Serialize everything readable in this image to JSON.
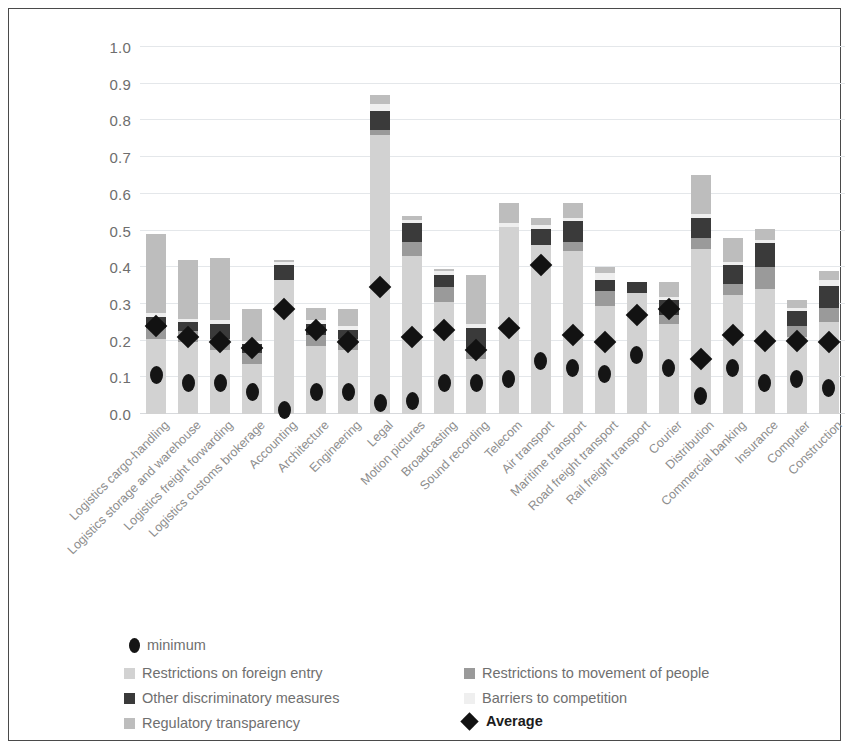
{
  "chart_data": {
    "type": "bar",
    "subtype": "stacked-bar-with-markers",
    "title": "",
    "xlabel": "",
    "ylabel": "",
    "ylim": [
      0.0,
      1.0
    ],
    "ytick_labels": [
      "1.0",
      "0.9",
      "0.8",
      "0.7",
      "0.6",
      "0.5",
      "0.4",
      "0.3",
      "0.2",
      "0.1",
      "0.0"
    ],
    "ytick_values": [
      1.0,
      0.9,
      0.8,
      0.7,
      0.6,
      0.5,
      0.4,
      0.3,
      0.2,
      0.1,
      0.0
    ],
    "grid": true,
    "legend_position": "bottom",
    "legend": [
      {
        "label": "minimum",
        "marker": "ellipse",
        "color": "#151515"
      },
      {
        "label": "Restrictions on foreign entry",
        "marker": "square",
        "color": "#d2d2d2"
      },
      {
        "label": "Other discriminatory measures",
        "marker": "square",
        "color": "#3a3a3a"
      },
      {
        "label": "Regulatory transparency",
        "marker": "square",
        "color": "#bdbdbd"
      },
      {
        "label": "Restrictions to movement of people",
        "marker": "square",
        "color": "#9a9a9a"
      },
      {
        "label": "Barriers to competition",
        "marker": "square",
        "color": "#efefef"
      },
      {
        "label": "Average",
        "marker": "diamond",
        "color": "#121212"
      }
    ],
    "categories": [
      "Logistics cargo-handling",
      "Logistics storage and warehouse",
      "Logistics freight forwarding",
      "Logistics customs brokerage",
      "Accounting",
      "Architecture",
      "Engineering",
      "Legal",
      "Motion pictures",
      "Broadcasting",
      "Sound recording",
      "Telecom",
      "Air transport",
      "Maritime transport",
      "Road freight transport",
      "Rail freight transport",
      "Courier",
      "Distribution",
      "Commercial banking",
      "Insurance",
      "Computer",
      "Construction"
    ],
    "series": [
      {
        "name": "Restrictions on foreign entry",
        "values": [
          0.205,
          0.195,
          0.175,
          0.135,
          0.365,
          0.185,
          0.175,
          0.76,
          0.43,
          0.305,
          0.15,
          0.51,
          0.46,
          0.445,
          0.295,
          0.33,
          0.245,
          0.45,
          0.325,
          0.34,
          0.21,
          0.25
        ]
      },
      {
        "name": "Restrictions to movement of people",
        "values": [
          0.03,
          0.03,
          0.03,
          0.03,
          0.0,
          0.03,
          0.03,
          0.015,
          0.04,
          0.04,
          0.03,
          0.0,
          0.0,
          0.025,
          0.04,
          0.0,
          0.025,
          0.03,
          0.03,
          0.06,
          0.03,
          0.04
        ]
      },
      {
        "name": "Other discriminatory measures",
        "values": [
          0.03,
          0.025,
          0.04,
          0.025,
          0.04,
          0.03,
          0.025,
          0.05,
          0.05,
          0.035,
          0.055,
          0.0,
          0.045,
          0.055,
          0.03,
          0.03,
          0.04,
          0.055,
          0.05,
          0.065,
          0.04,
          0.06
        ]
      },
      {
        "name": "Barriers to competition",
        "values": [
          0.01,
          0.01,
          0.01,
          0.01,
          0.01,
          0.01,
          0.01,
          0.02,
          0.01,
          0.01,
          0.01,
          0.01,
          0.01,
          0.01,
          0.02,
          0.0,
          0.01,
          0.01,
          0.01,
          0.01,
          0.01,
          0.015
        ]
      },
      {
        "name": "Regulatory transparency",
        "values": [
          0.215,
          0.16,
          0.17,
          0.085,
          0.005,
          0.035,
          0.045,
          0.025,
          0.01,
          0.005,
          0.135,
          0.055,
          0.02,
          0.04,
          0.015,
          0.0,
          0.04,
          0.105,
          0.065,
          0.03,
          0.02,
          0.025
        ]
      }
    ],
    "totals": [
      0.49,
      0.42,
      0.425,
      0.285,
      0.42,
      0.29,
      0.285,
      0.87,
      0.54,
      0.395,
      0.38,
      0.575,
      0.535,
      0.575,
      0.4,
      0.36,
      0.36,
      0.65,
      0.48,
      0.505,
      0.31,
      0.39
    ],
    "minimum": {
      "name": "minimum",
      "values": [
        0.105,
        0.085,
        0.085,
        0.06,
        0.01,
        0.06,
        0.06,
        0.03,
        0.035,
        0.085,
        0.085,
        0.095,
        0.145,
        0.125,
        0.11,
        0.16,
        0.125,
        0.05,
        0.125,
        0.085,
        0.095,
        0.07
      ]
    },
    "average": {
      "name": "Average",
      "values": [
        0.24,
        0.21,
        0.195,
        0.18,
        0.285,
        0.23,
        0.195,
        0.345,
        0.21,
        0.23,
        0.175,
        0.235,
        0.405,
        0.215,
        0.195,
        0.27,
        0.285,
        0.15,
        0.215,
        0.2,
        0.2,
        0.195
      ]
    }
  }
}
